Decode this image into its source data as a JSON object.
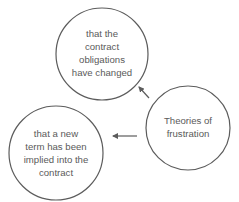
{
  "diagram": {
    "colors": {
      "stroke": "#5c5c5c",
      "text": "#5a5a5a",
      "background": "#ffffff"
    },
    "nodes": [
      {
        "id": "obligations-changed",
        "label": "that the\ncontract\nobligations\nhave changed",
        "cx": 102,
        "cy": 54,
        "r": 46
      },
      {
        "id": "implied-term",
        "label": "that a new\nterm has been\nimplied into the\ncontract",
        "cx": 56,
        "cy": 153,
        "r": 47
      },
      {
        "id": "theories-of-frustration",
        "label": "Theories of\nfrustration",
        "cx": 188,
        "cy": 128,
        "r": 42
      }
    ],
    "edges": [
      {
        "from": "theories-of-frustration",
        "to": "obligations-changed"
      },
      {
        "from": "theories-of-frustration",
        "to": "implied-term"
      }
    ]
  }
}
